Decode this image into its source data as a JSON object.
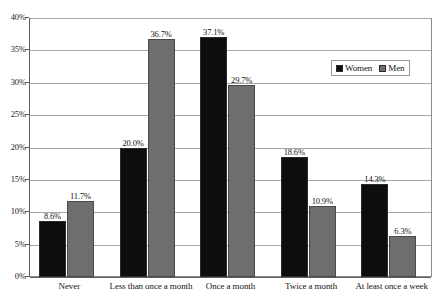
{
  "chart_data": {
    "type": "bar",
    "title": "",
    "subtitle": "",
    "xlabel": "",
    "ylabel": "",
    "ylim": [
      0,
      40
    ],
    "ytick_labels": [
      "0%",
      "5%",
      "10%",
      "15%",
      "20%",
      "25%",
      "30%",
      "35%",
      "40%"
    ],
    "ytick_values": [
      0,
      5,
      10,
      15,
      20,
      25,
      30,
      35,
      40
    ],
    "grid": true,
    "legend_position": "top-right-inside",
    "categories": [
      "Never",
      "Less than once a month",
      "Once a month",
      "Twice a month",
      "At least once a week"
    ],
    "series": [
      {
        "name": "Women",
        "color": "#0d0d0d",
        "values": [
          8.6,
          20.0,
          37.1,
          18.6,
          14.3
        ],
        "labels": [
          "8.6%",
          "20.0%",
          "37.1%",
          "18.6%",
          "14.3%"
        ]
      },
      {
        "name": "Men",
        "color": "#6e6e6e",
        "values": [
          11.7,
          36.7,
          29.7,
          10.9,
          6.3
        ],
        "labels": [
          "11.7%",
          "36.7%",
          "29.7%",
          "10.9%",
          "6.3%"
        ]
      }
    ]
  },
  "legend": {
    "entries": [
      {
        "label": "Women",
        "color": "#0d0d0d"
      },
      {
        "label": "Men",
        "color": "#6e6e6e"
      }
    ]
  },
  "colors": {
    "women_bar": "#0d0d0d",
    "men_bar": "#6e6e6e",
    "gridline": "#a8a8a8",
    "axis": "#5e5e5e",
    "frame": "#8d8d8d",
    "background": "#ffffff"
  }
}
